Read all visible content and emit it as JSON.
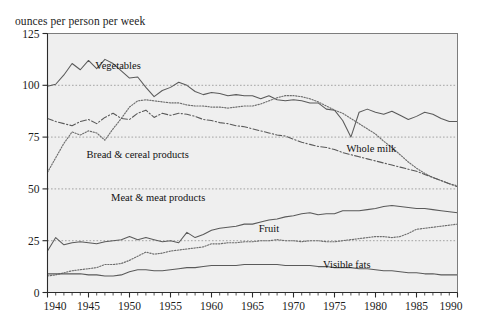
{
  "chart_data": {
    "type": "line",
    "title": "",
    "ylabel": "ounces per person per week",
    "xlabel": "",
    "xlim": [
      1940,
      1990
    ],
    "ylim": [
      0,
      125
    ],
    "yticks": [
      0,
      25,
      50,
      75,
      100,
      125
    ],
    "xticks": [
      1940,
      1945,
      1950,
      1955,
      1960,
      1965,
      1970,
      1975,
      1980,
      1985,
      1990
    ],
    "grid": "horizontal-dotted",
    "legend": "inline-annotations",
    "x": [
      1940,
      1941,
      1942,
      1943,
      1944,
      1945,
      1946,
      1947,
      1948,
      1949,
      1950,
      1951,
      1952,
      1953,
      1954,
      1955,
      1956,
      1957,
      1958,
      1959,
      1960,
      1961,
      1962,
      1963,
      1964,
      1965,
      1966,
      1967,
      1968,
      1969,
      1970,
      1971,
      1972,
      1973,
      1974,
      1975,
      1976,
      1977,
      1978,
      1979,
      1980,
      1981,
      1982,
      1983,
      1984,
      1985,
      1986,
      1987,
      1988,
      1989,
      1990
    ],
    "series": [
      {
        "name": "Vegetables",
        "style": "solid",
        "label_x": 1948.6,
        "label_y": 108,
        "values": [
          99.5,
          100.5,
          105.0,
          110.5,
          107.5,
          112.0,
          108.0,
          112.5,
          110.5,
          107.0,
          103.5,
          104.0,
          99.0,
          94.5,
          97.5,
          99.0,
          101.5,
          100.0,
          97.0,
          95.5,
          96.5,
          96.0,
          95.0,
          95.5,
          95.0,
          95.0,
          93.5,
          95.0,
          93.0,
          92.5,
          93.0,
          92.5,
          91.5,
          91.5,
          88.5,
          88.0,
          83.0,
          75.0,
          87.0,
          88.5,
          87.0,
          86.0,
          87.5,
          85.5,
          83.5,
          85.0,
          87.0,
          86.0,
          84.0,
          82.5,
          82.5
        ]
      },
      {
        "name": "Whole milk",
        "style": "dotted",
        "label_x": 1979.5,
        "label_y": 68,
        "values": [
          58.0,
          65.0,
          72.0,
          77.5,
          76.0,
          78.0,
          77.0,
          73.5,
          79.0,
          84.0,
          89.5,
          92.5,
          93.0,
          92.5,
          92.0,
          91.5,
          91.5,
          90.5,
          90.0,
          90.0,
          89.5,
          89.5,
          89.0,
          89.5,
          90.0,
          90.0,
          91.0,
          92.5,
          94.0,
          95.0,
          95.0,
          94.5,
          93.5,
          92.0,
          90.0,
          88.0,
          86.5,
          84.0,
          81.5,
          79.0,
          76.5,
          73.0,
          70.0,
          66.5,
          63.0,
          60.0,
          57.5,
          55.5,
          54.0,
          52.5,
          51.5
        ]
      },
      {
        "name": "Bread & cereal products",
        "style": "dashdot",
        "label_x": 1951.0,
        "label_y": 65,
        "values": [
          84.0,
          82.5,
          81.5,
          80.5,
          82.5,
          83.5,
          81.5,
          84.5,
          86.5,
          84.0,
          83.5,
          86.5,
          88.0,
          84.5,
          86.5,
          85.5,
          86.5,
          86.0,
          85.0,
          83.5,
          83.0,
          82.0,
          81.5,
          80.5,
          80.0,
          79.0,
          78.0,
          77.0,
          76.0,
          75.5,
          74.0,
          72.5,
          71.5,
          70.5,
          70.0,
          69.0,
          67.5,
          66.5,
          65.5,
          64.5,
          63.5,
          62.5,
          61.5,
          60.5,
          59.5,
          58.5,
          57.0,
          55.5,
          54.0,
          52.5,
          51.0
        ]
      },
      {
        "name": "Meat & meat products",
        "style": "solid",
        "label_x": 1953.5,
        "label_y": 44,
        "values": [
          20.0,
          26.5,
          23.0,
          24.0,
          24.5,
          24.0,
          23.5,
          24.5,
          25.0,
          25.5,
          27.0,
          25.5,
          26.5,
          25.5,
          24.5,
          25.0,
          24.0,
          29.0,
          26.5,
          28.0,
          30.0,
          31.0,
          31.5,
          32.0,
          33.0,
          33.0,
          34.0,
          35.0,
          35.5,
          36.5,
          37.0,
          38.0,
          38.5,
          37.5,
          38.0,
          38.0,
          39.5,
          39.5,
          39.5,
          40.0,
          40.5,
          41.5,
          42.0,
          41.5,
          41.0,
          40.5,
          40.5,
          40.0,
          39.5,
          39.0,
          38.5
        ]
      },
      {
        "name": "Fruit",
        "style": "dotted",
        "label_x": 1967.0,
        "label_y": 29,
        "values": [
          8.0,
          8.5,
          9.5,
          10.5,
          11.0,
          11.5,
          12.0,
          13.5,
          13.5,
          14.0,
          15.5,
          17.5,
          19.5,
          18.5,
          19.0,
          20.0,
          20.5,
          21.0,
          21.5,
          22.0,
          23.5,
          23.5,
          24.0,
          24.0,
          24.5,
          24.5,
          25.0,
          25.0,
          25.5,
          25.0,
          25.0,
          24.5,
          25.0,
          25.0,
          24.5,
          24.5,
          25.0,
          25.5,
          26.0,
          26.5,
          27.0,
          27.0,
          26.5,
          27.0,
          28.5,
          30.5,
          31.0,
          31.5,
          32.0,
          32.5,
          33.0
        ]
      },
      {
        "name": "Visible fats",
        "style": "solid",
        "label_x": 1976.5,
        "label_y": 12,
        "values": [
          9.0,
          9.0,
          9.0,
          9.0,
          9.0,
          8.5,
          8.5,
          8.0,
          8.0,
          8.5,
          10.0,
          11.0,
          11.0,
          10.5,
          10.5,
          11.0,
          11.5,
          12.0,
          12.0,
          12.5,
          13.0,
          13.0,
          13.0,
          13.0,
          13.5,
          13.5,
          13.5,
          13.5,
          13.5,
          13.0,
          13.0,
          13.0,
          13.0,
          12.5,
          12.5,
          12.0,
          12.0,
          12.0,
          11.5,
          11.5,
          11.0,
          10.5,
          10.5,
          10.0,
          9.5,
          9.5,
          9.0,
          9.0,
          8.5,
          8.5,
          8.5
        ]
      }
    ]
  },
  "colors": {
    "plot_background": "#efefef",
    "grid": "#9b9b9b",
    "axis": "#2b2b2b",
    "line": "#5a5a5a",
    "text": "#1c1c1c"
  }
}
